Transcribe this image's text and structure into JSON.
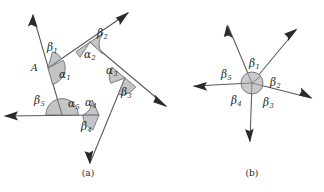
{
  "figure": {
    "title_a": "(a)",
    "title_b": "(b)",
    "canvas": {
      "width": 324,
      "height": 192,
      "background": "#ffffff"
    },
    "colors": {
      "line": "#58595b",
      "arrow": "#2b2b2b",
      "sector_fill": "#c3c4c6",
      "sector_stroke": "#6c6d70",
      "text": "#231f20"
    }
  },
  "panel_a": {
    "caption": "(a)",
    "caption_pos": {
      "x": 88,
      "y": 176
    },
    "description": "Convex pentagon with each side extended into a ray; interior angles alpha and exterior angles beta are marked at every vertex.",
    "vertices": [
      {
        "name": "A",
        "x": 48,
        "y": 68,
        "label": "A",
        "label_x": 31,
        "label_y": 71
      },
      {
        "name": "B",
        "x": 90,
        "y": 42
      },
      {
        "name": "C",
        "x": 125,
        "y": 78
      },
      {
        "name": "D",
        "x": 99,
        "y": 115
      },
      {
        "name": "E",
        "x": 62,
        "y": 115
      }
    ],
    "rays": [
      {
        "name": "ray-from-A-upper-left",
        "tip_x": 33,
        "tip_y": 15
      },
      {
        "name": "ray-from-B-upper-right",
        "tip_x": 128,
        "tip_y": 13
      },
      {
        "name": "ray-from-C-lower-right",
        "tip_x": 166,
        "tip_y": 106
      },
      {
        "name": "ray-from-D-lower",
        "tip_x": 90,
        "tip_y": 163
      },
      {
        "name": "ray-from-E-left",
        "tip_x": 5,
        "tip_y": 116
      }
    ],
    "interior_angles": [
      {
        "symbol": "α",
        "sub": "1",
        "x": 59,
        "y": 78
      },
      {
        "symbol": "α",
        "sub": "2",
        "x": 84,
        "y": 58
      },
      {
        "symbol": "α",
        "sub": "3",
        "x": 106,
        "y": 74
      },
      {
        "symbol": "α",
        "sub": "4",
        "x": 85,
        "y": 106
      },
      {
        "symbol": "α",
        "sub": "5",
        "x": 68,
        "y": 107
      }
    ],
    "exterior_angles": [
      {
        "symbol": "β",
        "sub": "1",
        "x": 51,
        "y": 51
      },
      {
        "symbol": "β",
        "sub": "2",
        "x": 99,
        "y": 37
      },
      {
        "symbol": "β",
        "sub": "3",
        "x": 122,
        "y": 94
      },
      {
        "symbol": "β",
        "sub": "4",
        "x": 86,
        "y": 128
      },
      {
        "symbol": "β",
        "sub": "5",
        "x": 40,
        "y": 103
      }
    ]
  },
  "panel_b": {
    "caption": "(b)",
    "caption_pos": {
      "x": 252,
      "y": 176
    },
    "description": "The five exterior angles beta translated to a common point, filling one full revolution of 360 degrees.",
    "center": {
      "x": 252,
      "y": 83
    },
    "circle_radius": 11,
    "rays": [
      {
        "name": "ray-upper-left",
        "tip_x": 228,
        "tip_y": 26
      },
      {
        "name": "ray-upper-right",
        "tip_x": 296,
        "tip_y": 30
      },
      {
        "name": "ray-lower-right",
        "tip_x": 311,
        "tip_y": 98
      },
      {
        "name": "ray-lower",
        "tip_x": 250,
        "tip_y": 141
      },
      {
        "name": "ray-left",
        "tip_x": 194,
        "tip_y": 86
      }
    ],
    "angle_labels": [
      {
        "symbol": "β",
        "sub": "1",
        "x": 253,
        "y": 65
      },
      {
        "symbol": "β",
        "sub": "2",
        "x": 275,
        "y": 82
      },
      {
        "symbol": "β",
        "sub": "3",
        "x": 270,
        "y": 104
      },
      {
        "symbol": "β",
        "sub": "4",
        "x": 235,
        "y": 101
      },
      {
        "symbol": "β",
        "sub": "5",
        "x": 228,
        "y": 77
      }
    ]
  }
}
